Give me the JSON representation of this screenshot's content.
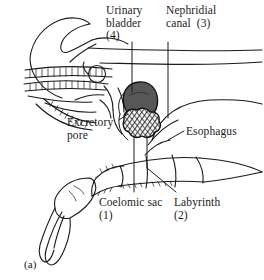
{
  "figure": {
    "panel_label": "(a)",
    "background_color": "#ffffff",
    "ink_color": "#1a1a1a"
  },
  "labels": {
    "urinary_bladder": {
      "line1": "Urinary",
      "line2": "bladder",
      "line3": "(4)",
      "number": "4",
      "text": "Urinary bladder (4)"
    },
    "nephridial_canal": {
      "line1": "Nephridial",
      "line2": "canal  (3)",
      "number": "3",
      "text": "Nephridial canal (3)"
    },
    "excretory_pore": {
      "line1": "Excretory",
      "line2": "pore",
      "text": "Excretory pore"
    },
    "esophagus": {
      "text": "Esophagus"
    },
    "coelomic_sac": {
      "line1": "Coelomic sac",
      "line2": "(1)",
      "number": "1",
      "text": "Coelomic sac (1)"
    },
    "labyrinth": {
      "line1": "Labyrinth",
      "line2": "(2)",
      "number": "2",
      "text": "Labyrinth (2)"
    }
  },
  "structures": {
    "urinary_bladder": {
      "fill": "#57575a",
      "stroke": "#111111"
    },
    "labyrinth": {
      "fill": "#2b2b2b",
      "pattern": "cross-hatch",
      "stroke": "#111111"
    },
    "carapace": {
      "fill": "none",
      "stroke": "#1a1a1a"
    },
    "antennae": {
      "fill": "none",
      "stroke": "#1a1a1a"
    },
    "cheliped": {
      "fill": "none",
      "stroke": "#1a1a1a"
    }
  }
}
